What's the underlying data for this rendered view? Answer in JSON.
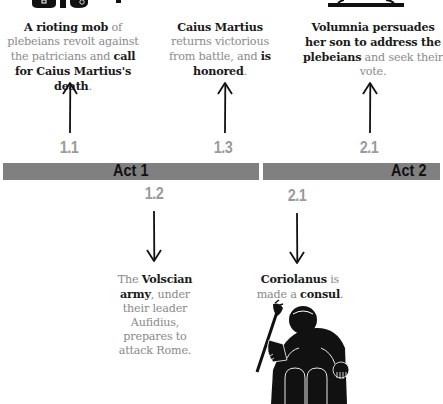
{
  "timeline": {
    "acts": [
      {
        "label": "Act 1"
      },
      {
        "label": "Act 2"
      }
    ],
    "colors": {
      "bar": "#808080",
      "scene_number": "#9a9a9a",
      "text_bold": "#1a1a1a",
      "text_regular": "#8a8a8a"
    }
  },
  "events_above": [
    {
      "scene": "1.1",
      "parts": [
        {
          "text": "A rioting mob",
          "bold": true
        },
        {
          "text": " of plebeians revolt against the patricians and ",
          "bold": false
        },
        {
          "text": "call for Caius Martius's death",
          "bold": true
        },
        {
          "text": ".",
          "bold": false
        }
      ]
    },
    {
      "scene": "1.3",
      "parts": [
        {
          "text": "Caius Martius",
          "bold": true
        },
        {
          "text": " returns victorious from battle, and ",
          "bold": false
        },
        {
          "text": "is honored",
          "bold": true
        },
        {
          "text": ".",
          "bold": false
        }
      ]
    },
    {
      "scene": "2.1",
      "parts": [
        {
          "text": "Volumnia persuades her son to address the plebeians",
          "bold": true
        },
        {
          "text": " and seek their vote.",
          "bold": false
        }
      ]
    }
  ],
  "events_below": [
    {
      "scene": "1.2",
      "parts": [
        {
          "text": "The ",
          "bold": false
        },
        {
          "text": "Volscian army",
          "bold": true
        },
        {
          "text": ", under their leader Aufidius, prepares to attack Rome.",
          "bold": false
        }
      ]
    },
    {
      "scene": "2.1",
      "parts": [
        {
          "text": "Coriolanus",
          "bold": true
        },
        {
          "text": " is made a ",
          "bold": false
        },
        {
          "text": "consul",
          "bold": true
        },
        {
          "text": ".",
          "bold": false
        }
      ]
    }
  ],
  "illustrations": [
    {
      "name": "mob-figures-icon"
    },
    {
      "name": "platform-icon"
    },
    {
      "name": "enthroned-consul-icon"
    }
  ]
}
